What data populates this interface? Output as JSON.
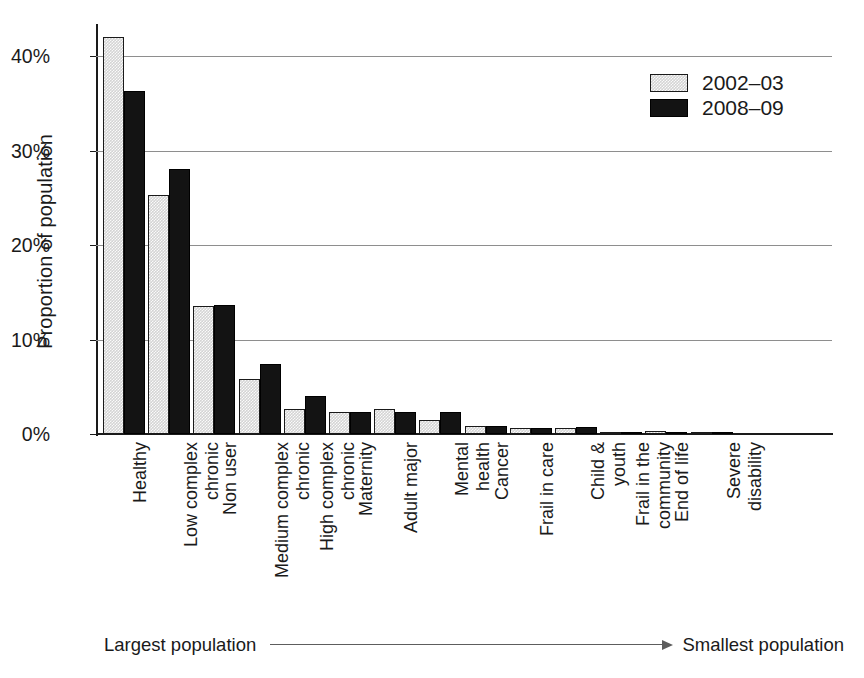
{
  "chart_data": {
    "type": "bar",
    "title": "",
    "xlabel": "",
    "ylabel": "Proportion of population",
    "ylim": [
      0,
      44
    ],
    "grid": true,
    "legend_position": "top-right",
    "y_ticks": [
      "0%",
      "10%",
      "20%",
      "30%",
      "40%"
    ],
    "y_tick_values": [
      0,
      10,
      20,
      30,
      40
    ],
    "categories": [
      "Healthy",
      "Low complex\nchronic",
      "Non user",
      "Medium complex\nchronic",
      "High complex\nchronic",
      "Maternity",
      "Adult major",
      "Mental\nhealth",
      "Cancer",
      "Frail in care",
      "Child &\nyouth",
      "Frail in the\ncommunity",
      "End of life",
      "Severe\ndisability"
    ],
    "series": [
      {
        "name": "2002–03",
        "color": "#d4d4d4",
        "values": [
          42.0,
          25.3,
          13.5,
          5.8,
          2.7,
          2.3,
          2.6,
          1.5,
          0.8,
          0.6,
          0.6,
          0.25,
          0.3,
          0.2
        ]
      },
      {
        "name": "2008–09",
        "color": "#131313",
        "values": [
          36.3,
          28.0,
          13.6,
          7.4,
          4.0,
          2.3,
          2.3,
          2.3,
          0.9,
          0.6,
          0.7,
          0.25,
          0.25,
          0.2
        ]
      }
    ],
    "annotations": {
      "left_note": "Largest population",
      "right_note": "Smallest population",
      "arrow": "rightwards-arrow"
    }
  },
  "legend": {
    "entries": [
      {
        "label": "2002–03",
        "swatch": "light-gray-hatched"
      },
      {
        "label": "2008–09",
        "swatch": "solid-black"
      }
    ]
  },
  "colors": {
    "series_2002": "#d4d4d4",
    "series_2008": "#131313",
    "gridline": "#8e8e8e",
    "axis": "#1a1a1a",
    "background": "#ffffff",
    "arrow": "#5d5d5d"
  }
}
